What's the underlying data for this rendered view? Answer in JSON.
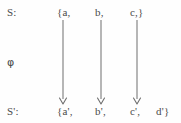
{
  "diagram": {
    "type": "set-mapping-diagram",
    "title": "",
    "stroke_color": "#6e6e6e",
    "text_color": "#4a4a4a",
    "background_color": "#fefefe",
    "rows": {
      "source": {
        "label": "S:",
        "items": [
          "{a,",
          "b,",
          "c,}"
        ]
      },
      "mapping": {
        "label": "φ"
      },
      "target": {
        "label": "S':",
        "items": [
          "{a',",
          "b',",
          "c',",
          "d'}"
        ]
      }
    },
    "arrows": [
      {
        "name": "arrow-a-to-a-prime",
        "x": 63,
        "y_start": 20,
        "y_end": 104
      },
      {
        "name": "arrow-b-to-b-prime",
        "x": 101,
        "y_start": 20,
        "y_end": 104
      },
      {
        "name": "arrow-c-to-c-prime",
        "x": 137,
        "y_start": 20,
        "y_end": 104
      }
    ]
  }
}
